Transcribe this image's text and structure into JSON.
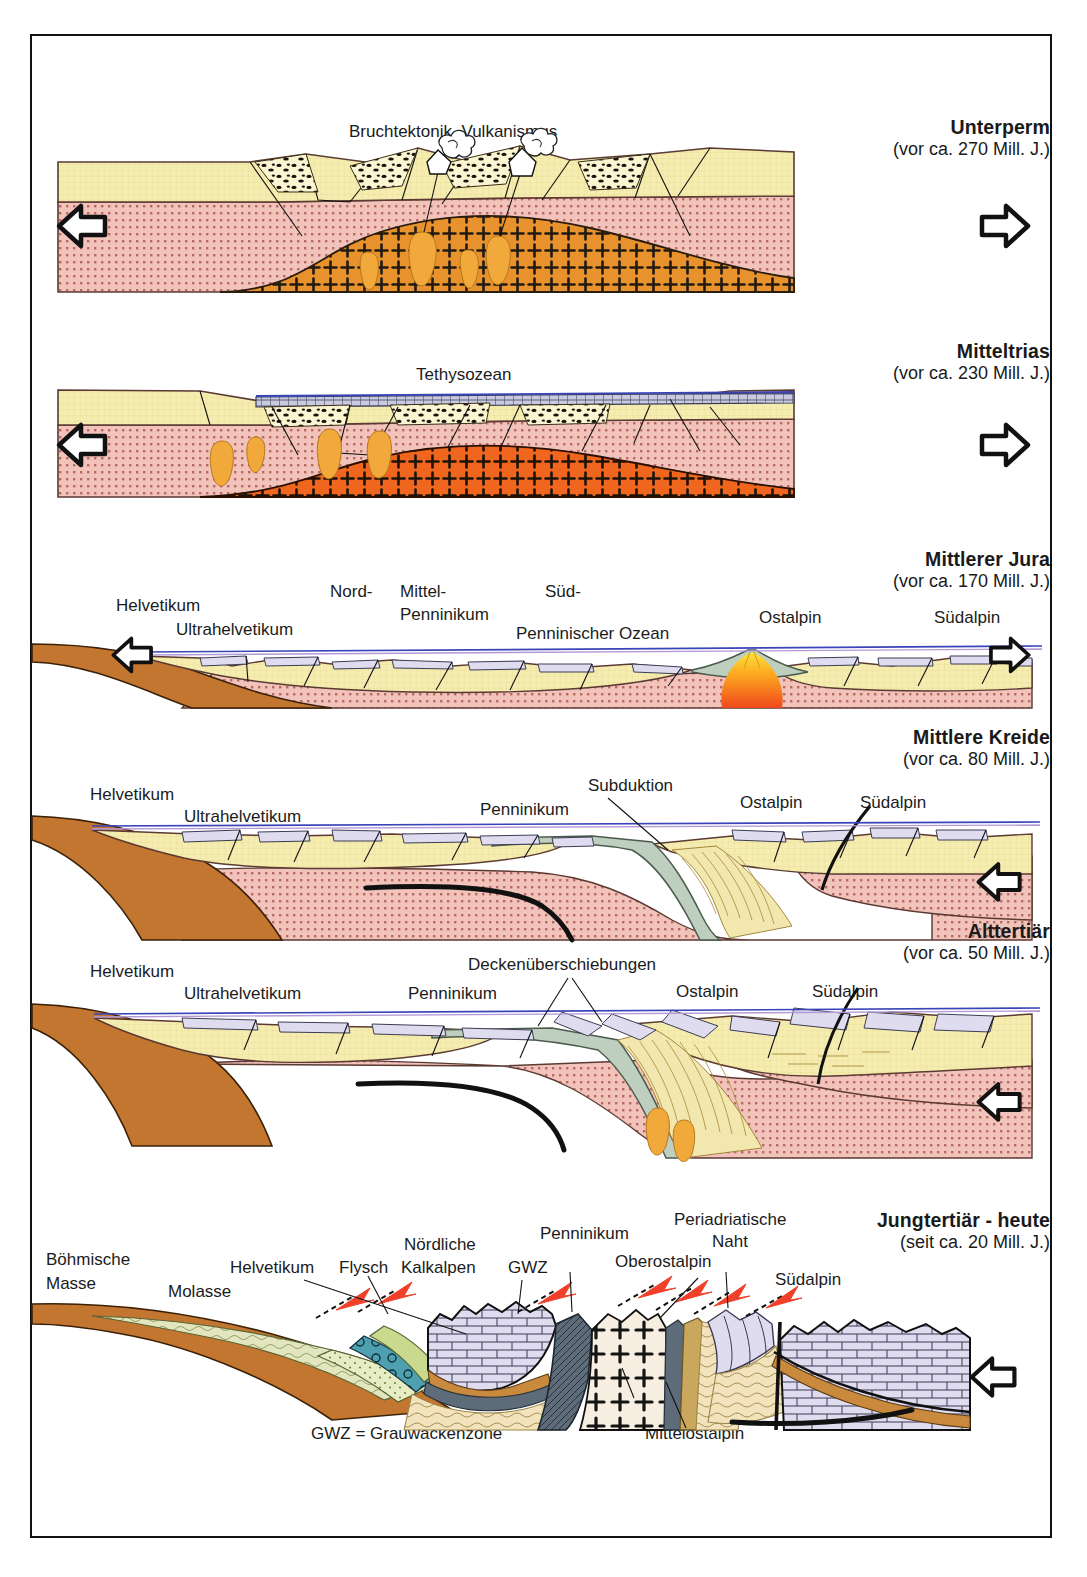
{
  "figure": {
    "title_hidden": "",
    "panels": [
      {
        "id": "unterperm",
        "title": "Unterperm",
        "age": "(vor ca. 270 Mill. J.)",
        "labels": {
          "top": "Bruchtektonik, Vulkanismus",
          "bottom": "Granitintrusionen"
        },
        "arrows": [
          "left",
          "right"
        ]
      },
      {
        "id": "mitteltrias",
        "title": "Mitteltrias",
        "age": "(vor ca. 230 Mill. J.)",
        "labels": {
          "ocean": "Tethysozean"
        },
        "arrows": [
          "left",
          "right"
        ]
      },
      {
        "id": "mittlerer-jura",
        "title": "Mittlerer Jura",
        "age": "(vor ca. 170 Mill. J.)",
        "labels": {
          "helvetikum": "Helvetikum",
          "ultrahelvetikum": "Ultrahelvetikum",
          "nord": "Nord-",
          "mittel": "Mittel-",
          "sued": "Süd-",
          "penninikum": "Penninikum",
          "ozean": "Penninischer Ozean",
          "ostalpin": "Ostalpin",
          "suedalpin": "Südalpin"
        },
        "arrows": [
          "left",
          "right"
        ]
      },
      {
        "id": "mittlere-kreide",
        "title": "Mittlere Kreide",
        "age": "(vor ca. 80 Mill. J.)",
        "labels": {
          "helvetikum": "Helvetikum",
          "ultrahelvetikum": "Ultrahelvetikum",
          "penninikum": "Penninikum",
          "subduktion": "Subduktion",
          "ostalpin": "Ostalpin",
          "suedalpin": "Südalpin"
        },
        "arrows": [
          "left"
        ]
      },
      {
        "id": "alttertiaer",
        "title": "Alttertiär",
        "age": "(vor ca. 50 Mill. J.)",
        "labels": {
          "helvetikum": "Helvetikum",
          "ultrahelvetikum": "Ultrahelvetikum",
          "penninikum": "Penninikum",
          "decken": "Deckenüberschiebungen",
          "ostalpin": "Ostalpin",
          "suedalpin": "Südalpin"
        },
        "arrows": [
          "left"
        ]
      },
      {
        "id": "jungtertiaer",
        "title": "Jungtertiär - heute",
        "age": "(seit ca. 20 Mill. J.)",
        "labels": {
          "boehmische": "Böhmische",
          "masse": "Masse",
          "molasse": "Molasse",
          "helvetikum": "Helvetikum",
          "flysch": "Flysch",
          "noerdliche": "Nördliche",
          "kalkalpen": "Kalkalpen",
          "gwz": "GWZ",
          "penninikum": "Penninikum",
          "oberostalpin": "Oberostalpin",
          "periadriatische": "Periadriatische",
          "naht": "Naht",
          "suedalpin": "Südalpin",
          "unterostalpin": "Unterostalpin",
          "mittelostalpin": "Mittelostalpin",
          "legend": "GWZ = Grauwackenzone"
        },
        "arrows": [
          "left"
        ]
      }
    ]
  },
  "colors": {
    "sediment_yellow": "#F5EDB0",
    "basement_pink": "#F2C3BB",
    "granite_orange": "#E8922E",
    "magma_orange": "#F0661F",
    "magma_yellow": "#FDBE2E",
    "ocean_crust_green": "#BECFC0",
    "mantle_brown": "#C2762F",
    "limestone_lilac": "#DEDCEE",
    "water_blue": "#3A43B8",
    "flysch_green": "#C9D98E",
    "molasse_olive": "#E2E6BE",
    "teal_band": "#4E9FB0",
    "dark_slate": "#5E6B78",
    "tan_band": "#C9A85E",
    "thrust_red": "#F0402A",
    "frame": "#111111"
  }
}
